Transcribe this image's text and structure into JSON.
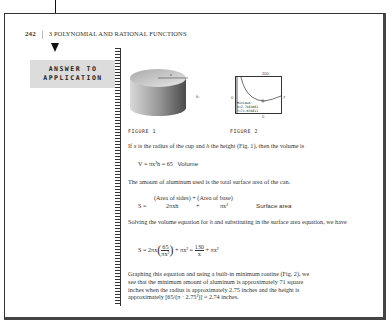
{
  "header": {
    "page_number": "242",
    "chapter_title": "3 POLYNOMIAL AND RATIONAL FUNCTIONS"
  },
  "sidebar": {
    "banner_line1": "ANSWER TO",
    "banner_line2": "APPLICATION"
  },
  "figures": {
    "fig1": {
      "label": "FIGURE 1",
      "radius_label": "x",
      "height_label": "h"
    },
    "fig2": {
      "label": "FIGURE 2",
      "y_max": "200",
      "x_min": "0",
      "x_max": "7",
      "y_min": "0",
      "readout_line1": "Minimum",
      "readout_line2": "X=2.7481081  Y=71.034811"
    }
  },
  "body": {
    "para1_a": "If ",
    "para1_x": "x",
    "para1_b": " is the radius of the cup and ",
    "para1_h": "h",
    "para1_c": " the height (Fig. 1), then the volume is",
    "eq1": "V = πx²h = 65",
    "eq1_label": "Volume",
    "para2": "The amount of aluminum used is the total surface area of the can.",
    "eq2_top": "(Area of sides) + (Area of base)",
    "eq2_left": "S =",
    "eq2_t1": "2πxh",
    "eq2_plus": "+",
    "eq2_t2": "πx²",
    "eq2_label": "Surface area",
    "para3_a": "Solving the volume equation for ",
    "para3_h": "h",
    "para3_b": " and substituting in the surface area equation, we have",
    "eq3_left": "S = 2πx",
    "eq3_num1": "65",
    "eq3_den1": "πx²",
    "eq3_mid": "+ πx² =",
    "eq3_num2": "130",
    "eq3_den2": "x",
    "eq3_tail": "+ πx²",
    "para4_l1": "Graphing this equation and using a built-in minimum routine (Fig. 2), we",
    "para4_l2": "see that the minimum amount of aluminum is approximately 71 square",
    "para4_l3": "inches when the radius is approximately 2.75 inches and the height is",
    "para4_l4": "approximately [65/(π · 2.75²)] ≈ 2.74 inches."
  }
}
